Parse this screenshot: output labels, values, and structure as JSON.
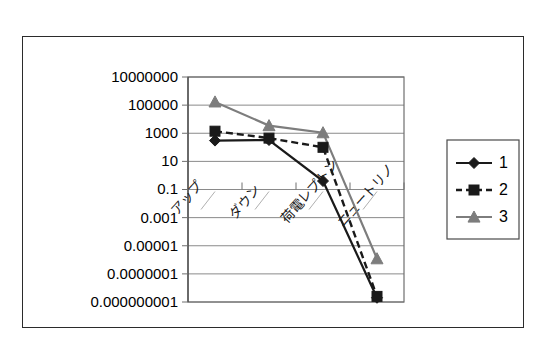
{
  "figure": {
    "has_outer_frame": true,
    "background_color": "#ffffff"
  },
  "chart_data": {
    "type": "line",
    "title": "",
    "subtitle": "",
    "xlabel": "",
    "ylabel": "",
    "log_y": true,
    "grid": true,
    "legend_position": "right",
    "categories": [
      "アップ",
      "ダウン",
      "荷電レプトン",
      "ニュートリノ"
    ],
    "y_tick_labels": [
      "10000000",
      "100000",
      "1000",
      "10",
      "0.1",
      "0.001",
      "0.00001",
      "0.0000001",
      "0.000000001"
    ],
    "y_tick_values": [
      10000000.0,
      100000.0,
      1000.0,
      10,
      0.1,
      0.001,
      1e-05,
      1e-07,
      1e-09
    ],
    "ylim": [
      1e-09,
      10000000.0
    ],
    "series": [
      {
        "name": "1",
        "marker": "diamond",
        "line_style": "solid",
        "color": "#1a1a1a",
        "values": [
          300,
          330,
          0.4,
          2e-09
        ]
      },
      {
        "name": "2",
        "marker": "square",
        "line_style": "dashed",
        "color": "#1a1a1a",
        "values": [
          1400,
          450,
          100,
          2.5e-09
        ]
      },
      {
        "name": "3",
        "marker": "triangle",
        "line_style": "solid",
        "color": "#7d7d7d",
        "values": [
          170000,
          3500,
          1100,
          1.2e-06
        ]
      }
    ],
    "colors": {
      "series_1": "#1a1a1a",
      "series_2": "#1a1a1a",
      "series_3": "#7d7d7d",
      "gridline": "#8a8a8a",
      "axis": "#4a4a4a"
    }
  },
  "legend": {
    "entries": [
      {
        "label": "1"
      },
      {
        "label": "2"
      },
      {
        "label": "3"
      }
    ]
  }
}
